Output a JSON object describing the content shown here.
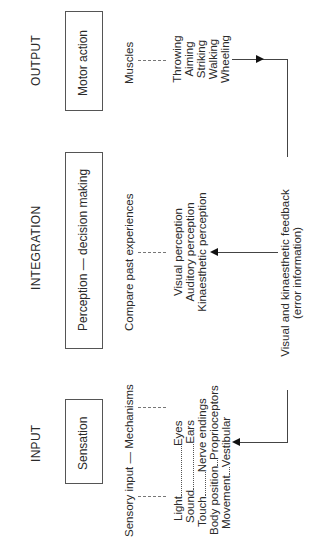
{
  "headers": {
    "output": "OUTPUT",
    "integration": "INTEGRATION",
    "input": "INPUT"
  },
  "boxes": {
    "motor_action": "Motor action",
    "perception": "Perception — decision making",
    "sensation": "Sensation"
  },
  "labels": {
    "muscles": "Muscles",
    "compare": "Compare past experiences",
    "sensory_input": "Sensory input — Mechanisms",
    "feedback_line1": "Visual and kinaesthetic feedback",
    "feedback_line2": "(error information)"
  },
  "output_actions": [
    "Throwing",
    "Aiming",
    "Striking",
    "Walking",
    "Wheeling"
  ],
  "perception_types": [
    "Visual perception",
    "Auditory perception",
    "Kinaesthetic perception"
  ],
  "sensory_pairs": [
    {
      "input": "Light",
      "mechanism": "Eyes"
    },
    {
      "input": "Sound",
      "mechanism": "Ears"
    },
    {
      "input": "Touch",
      "mechanism": "Nerve endings"
    },
    {
      "input": "Body position",
      "mechanism": "Proprioceptors"
    },
    {
      "input": "Movement",
      "mechanism": "Vestibular"
    }
  ]
}
